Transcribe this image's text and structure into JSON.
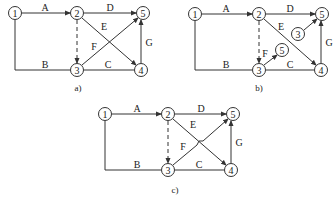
{
  "diagrams": [
    {
      "id": "a",
      "caption": "a)",
      "caption_pos": [
        78,
        88
      ],
      "nodes": [
        {
          "label": "1",
          "x": 15,
          "y": 13
        },
        {
          "label": "2",
          "x": 77,
          "y": 13
        },
        {
          "label": "5",
          "x": 143,
          "y": 13
        },
        {
          "label": "3",
          "x": 77,
          "y": 70
        },
        {
          "label": "4",
          "x": 141,
          "y": 70
        }
      ],
      "edges": [
        {
          "label": "A",
          "label_pos": [
            45,
            7
          ],
          "points": [
            [
              22,
              13
            ],
            [
              70,
              13
            ]
          ],
          "arrow": true,
          "dashed": false
        },
        {
          "label": "D",
          "label_pos": [
            110,
            7
          ],
          "points": [
            [
              84,
              13
            ],
            [
              136,
              13
            ]
          ],
          "arrow": true,
          "dashed": false
        },
        {
          "label": "E",
          "label_pos": [
            104,
            26
          ],
          "points": [
            [
              82,
              18
            ],
            [
              136,
              65
            ]
          ],
          "arrow": true,
          "dashed": false
        },
        {
          "label": "F",
          "label_pos": [
            94,
            46
          ],
          "points": [
            [
              82,
              65
            ],
            [
              138,
              18
            ]
          ],
          "arrow": true,
          "dashed": false
        },
        {
          "label": "G",
          "label_pos": [
            149,
            42
          ],
          "points": [
            [
              141,
              63
            ],
            [
              141,
              20
            ]
          ],
          "arrow": true,
          "dashed": false
        },
        {
          "label": "B",
          "label_pos": [
            45,
            64
          ],
          "points": [
            [
              15,
              20
            ],
            [
              15,
              70
            ],
            [
              70,
              70
            ]
          ],
          "arrow": false,
          "dashed": false
        },
        {
          "label": "C",
          "label_pos": [
            108,
            64
          ],
          "points": [
            [
              84,
              70
            ],
            [
              134,
              70
            ]
          ],
          "arrow": false,
          "dashed": false
        },
        {
          "label": "",
          "label_pos": [
            0,
            0
          ],
          "points": [
            [
              77,
              20
            ],
            [
              77,
              63
            ]
          ],
          "arrow": true,
          "dashed": true
        }
      ]
    },
    {
      "id": "b",
      "caption": "b)",
      "caption_pos": [
        259,
        88
      ],
      "nodes": [
        {
          "label": "1",
          "x": 195,
          "y": 14
        },
        {
          "label": "2",
          "x": 259,
          "y": 14
        },
        {
          "label": "5",
          "x": 322,
          "y": 14
        },
        {
          "label": "3",
          "x": 298,
          "y": 34
        },
        {
          "label": "5",
          "x": 282,
          "y": 50
        },
        {
          "label": "3",
          "x": 259,
          "y": 70
        },
        {
          "label": "4",
          "x": 321,
          "y": 70
        }
      ],
      "edges": [
        {
          "label": "A",
          "label_pos": [
            226,
            8
          ],
          "points": [
            [
              202,
              14
            ],
            [
              252,
              14
            ]
          ],
          "arrow": true,
          "dashed": false
        },
        {
          "label": "D",
          "label_pos": [
            290,
            8
          ],
          "points": [
            [
              266,
              14
            ],
            [
              315,
              14
            ]
          ],
          "arrow": true,
          "dashed": false
        },
        {
          "label": "E",
          "label_pos": [
            281,
            26
          ],
          "points": [
            [
              264,
              19
            ],
            [
              316,
              65
            ]
          ],
          "arrow": true,
          "dashed": false
        },
        {
          "label": "",
          "label_pos": [
            0,
            0
          ],
          "points": [
            [
              304,
              30
            ],
            [
              317,
              19
            ]
          ],
          "arrow": true,
          "dashed": false
        },
        {
          "label": "F",
          "label_pos": [
            265,
            53
          ],
          "points": [
            [
              264,
              65
            ],
            [
              277,
              55
            ]
          ],
          "arrow": true,
          "dashed": false
        },
        {
          "label": "G",
          "label_pos": [
            329,
            42
          ],
          "points": [
            [
              321,
              63
            ],
            [
              321,
              21
            ]
          ],
          "arrow": true,
          "dashed": false
        },
        {
          "label": "B",
          "label_pos": [
            226,
            64
          ],
          "points": [
            [
              195,
              21
            ],
            [
              195,
              70
            ],
            [
              252,
              70
            ]
          ],
          "arrow": false,
          "dashed": false
        },
        {
          "label": "C",
          "label_pos": [
            290,
            64
          ],
          "points": [
            [
              266,
              70
            ],
            [
              314,
              70
            ]
          ],
          "arrow": false,
          "dashed": false
        },
        {
          "label": "",
          "label_pos": [
            0,
            0
          ],
          "points": [
            [
              259,
              21
            ],
            [
              259,
              63
            ]
          ],
          "arrow": true,
          "dashed": true
        }
      ]
    },
    {
      "id": "c",
      "caption": "c)",
      "caption_pos": [
        175,
        190
      ],
      "nodes": [
        {
          "label": "1",
          "x": 105,
          "y": 114
        },
        {
          "label": "2",
          "x": 168,
          "y": 114
        },
        {
          "label": "5",
          "x": 233,
          "y": 114
        },
        {
          "label": "3",
          "x": 168,
          "y": 170
        },
        {
          "label": "4",
          "x": 231,
          "y": 170
        }
      ],
      "edges": [
        {
          "label": "A",
          "label_pos": [
            137,
            108
          ],
          "points": [
            [
              112,
              114
            ],
            [
              161,
              114
            ]
          ],
          "arrow": true,
          "dashed": false
        },
        {
          "label": "D",
          "label_pos": [
            201,
            108
          ],
          "points": [
            [
              175,
              114
            ],
            [
              226,
              114
            ]
          ],
          "arrow": true,
          "dashed": false
        },
        {
          "label": "E",
          "label_pos": [
            193,
            124
          ],
          "points": [
            [
              173,
              119
            ],
            [
              226,
              165
            ]
          ],
          "arrow": true,
          "dashed": false
        },
        {
          "label": "F",
          "label_pos": [
            183,
            146
          ],
          "points": [
            [
              173,
              165
            ],
            [
              197,
              145
            ],
            [
              199,
              141
            ],
            [
              203,
              141
            ],
            [
              228,
              119
            ]
          ],
          "arrow": true,
          "dashed": false
        },
        {
          "label": "G",
          "label_pos": [
            239,
            142
          ],
          "points": [
            [
              231,
              163
            ],
            [
              231,
              121
            ]
          ],
          "arrow": true,
          "dashed": false
        },
        {
          "label": "B",
          "label_pos": [
            137,
            164
          ],
          "points": [
            [
              105,
              121
            ],
            [
              105,
              170
            ],
            [
              161,
              170
            ]
          ],
          "arrow": false,
          "dashed": false
        },
        {
          "label": "C",
          "label_pos": [
            199,
            164
          ],
          "points": [
            [
              175,
              170
            ],
            [
              224,
              170
            ]
          ],
          "arrow": false,
          "dashed": false
        },
        {
          "label": "",
          "label_pos": [
            0,
            0
          ],
          "points": [
            [
              168,
              121
            ],
            [
              168,
              163
            ]
          ],
          "arrow": true,
          "dashed": true
        }
      ]
    }
  ],
  "colors": {
    "stroke": "#333333",
    "text": "#222222",
    "background": "#ffffff"
  }
}
